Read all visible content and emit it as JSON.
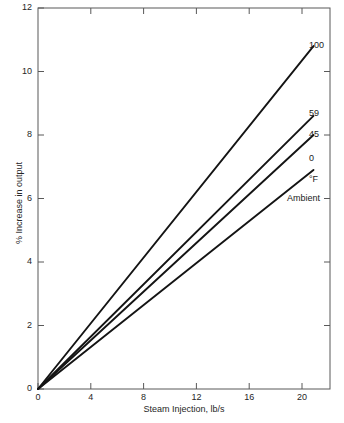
{
  "chart_data": {
    "type": "line",
    "title": "",
    "subtitle": "",
    "xlabel": "Steam Injection, lb/s",
    "ylabel": "% Increase in output",
    "xlim": [
      0,
      21.2
    ],
    "ylim": [
      0,
      12
    ],
    "xticks": [
      0,
      4,
      8,
      12,
      16,
      20
    ],
    "xtick_labels": [
      "0",
      "4",
      "8",
      "12",
      "16",
      "20"
    ],
    "yticks": [
      0,
      2,
      4,
      6,
      8,
      10,
      12
    ],
    "ytick_labels": [
      "0",
      "2",
      "4",
      "6",
      "8",
      "10",
      "12"
    ],
    "grid": false,
    "legend_position": "right-inline-end-of-line",
    "legend_title": "Ambient",
    "legend_units": "°F",
    "line_color": "#141414",
    "series": [
      {
        "name": "100",
        "label": "100",
        "x": [
          0,
          20
        ],
        "values": [
          0,
          10.8
        ]
      },
      {
        "name": "59",
        "label": "59",
        "x": [
          0,
          20
        ],
        "values": [
          0,
          8.6
        ]
      },
      {
        "name": "45",
        "label": "45",
        "x": [
          0,
          20
        ],
        "values": [
          0,
          8.0
        ]
      },
      {
        "name": "0",
        "label": "0",
        "x": [
          0,
          20
        ],
        "values": [
          0,
          6.9
        ]
      }
    ],
    "annotations": [
      {
        "text": "°F",
        "role": "units"
      },
      {
        "text": "Ambient",
        "role": "legend-title"
      }
    ]
  }
}
